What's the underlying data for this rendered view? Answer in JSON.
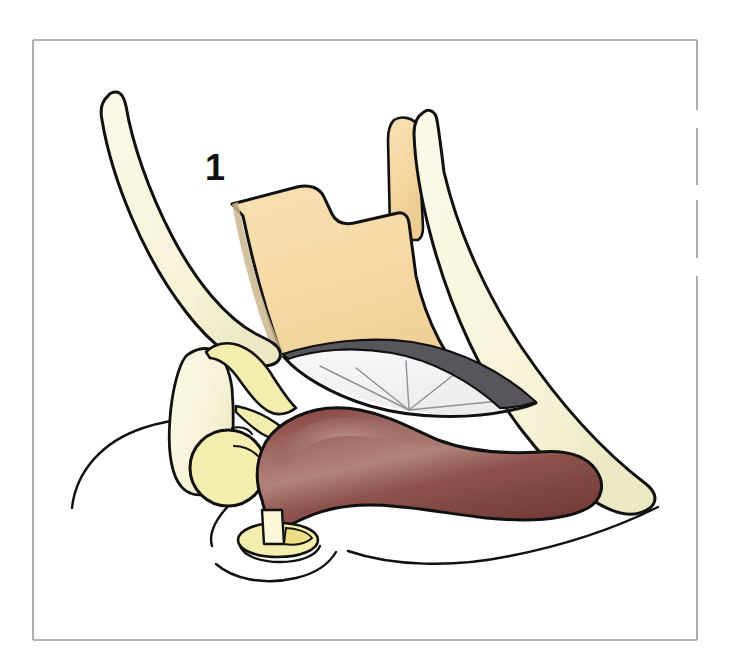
{
  "figure": {
    "kind": "anatomical-line-illustration",
    "caption_number": "1",
    "background_color": "#ffffff",
    "frame": {
      "color": "#9a9a9a",
      "stroke_width": 1.6,
      "x": 33,
      "y": 40,
      "width": 664,
      "height": 600,
      "dash_gaps": true
    },
    "outline_color": "#111111",
    "palette": {
      "bone_cream": "#F8F6DC",
      "bone_cream_shadow": "#EFEBC6",
      "fascia_tan": "#F6DCAA",
      "fascia_tan_shadow": "#E8C98F",
      "muscle_dark_red": "#8A4A46",
      "muscle_highlight": "#B07A72",
      "muscle_shadow": "#6E3733",
      "cartilage_white": "#F2F2F2",
      "cartilage_gray_line": "#8C8C94",
      "ligament_yellow": "#F3EEAE",
      "ligament_yellow_deep": "#EDE27F",
      "capsule_gray": "#5A5A5E",
      "label_color": "#111111"
    },
    "label": {
      "text": "1",
      "x": 205,
      "y": 180,
      "font_size": 36,
      "weight": "bold"
    },
    "structures": [
      {
        "name": "upper-left-bone-shaft",
        "fill": "bone_cream",
        "description": "long tapering bone shaft running from upper left down to centre"
      },
      {
        "name": "tan-fascia-sheet",
        "fill": "fascia_tan",
        "description": "large stepped tan sheet occupying the centre of the frame"
      },
      {
        "name": "upper-right-tan-strip",
        "fill": "fascia_tan",
        "description": "narrow vertical tan strip at upper right"
      },
      {
        "name": "upper-right-bone-shaft",
        "fill": "bone_cream",
        "description": "long cream bone descending from upper right to lower right tip"
      },
      {
        "name": "cartilage-lens",
        "fill": "cartilage_white",
        "description": "lens shaped pale region with radiating fan lines"
      },
      {
        "name": "fan-lines",
        "stroke": "cartilage_gray_line",
        "count": 5,
        "description": "five thin grey lines radiating from a convergence point"
      },
      {
        "name": "muscle-belly",
        "fill": "muscle_dark_red",
        "description": "large dark red muscle belly spanning the lower middle"
      },
      {
        "name": "triangular-bone-plate",
        "fill": "bone_cream",
        "description": "triangular cream plate at lower left"
      },
      {
        "name": "ligament-band",
        "fill": "ligament_yellow",
        "description": "curved pale yellow band above the circular body"
      },
      {
        "name": "circular-body",
        "fill": "ligament_yellow",
        "description": "pale yellow circle at lower left of the muscle"
      },
      {
        "name": "bottom-disc",
        "fill": "ligament_yellow",
        "description": "small oval disc with cream peg at the bottom centre"
      },
      {
        "name": "body-contour",
        "stroke": "outline_color",
        "description": "free sweeping contour lines indicating the body surface"
      }
    ]
  }
}
